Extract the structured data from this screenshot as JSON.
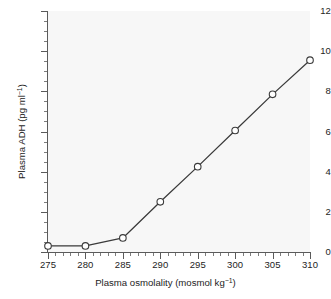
{
  "chart_data": {
    "type": "line",
    "title": "",
    "subtitle": "",
    "xlabel_plain": "Plasma osmolality (mosmol kg-1)",
    "ylabel_plain": "Plasma ADH (pg ml-1)",
    "xlabel_main": "Plasma osmolality (mosmol kg",
    "xlabel_sup": "−1",
    "xlabel_tail": ")",
    "ylabel_main": "Plasma ADH (pg ml",
    "ylabel_sup": "−1",
    "ylabel_tail": ")",
    "x": [
      275,
      280,
      285,
      290,
      295,
      300,
      305,
      310
    ],
    "values": [
      0.3,
      0.3,
      0.7,
      2.5,
      4.25,
      6.05,
      7.85,
      9.55
    ],
    "series": [
      {
        "name": "Plasma ADH",
        "values": [
          0.3,
          0.3,
          0.7,
          2.5,
          4.25,
          6.05,
          7.85,
          9.55
        ]
      }
    ],
    "xlim": [
      275,
      310
    ],
    "ylim": [
      0,
      12
    ],
    "xticks": [
      275,
      280,
      285,
      290,
      295,
      300,
      305,
      310
    ],
    "xtick_labels": [
      "275",
      "280",
      "285",
      "290",
      "295",
      "300",
      "305",
      "310"
    ],
    "yticks": [
      0,
      2,
      4,
      6,
      8,
      10,
      12
    ],
    "ytick_labels": [
      "0",
      "2",
      "4",
      "6",
      "8",
      "10",
      "12"
    ],
    "x_minor_step": 1,
    "y_minor_step": 0.5,
    "grid": false,
    "legend": null,
    "legend_position": "none",
    "marker": "open-circle",
    "line_color": "#3a3a3a",
    "marker_face_color": "#ffffff",
    "marker_edge_color": "#3a3a3a",
    "plot_background": "#f7f7f7",
    "figure_background": "#ffffff",
    "axis_color": "#5a5a5a",
    "text_color": "#1d1d1d"
  }
}
